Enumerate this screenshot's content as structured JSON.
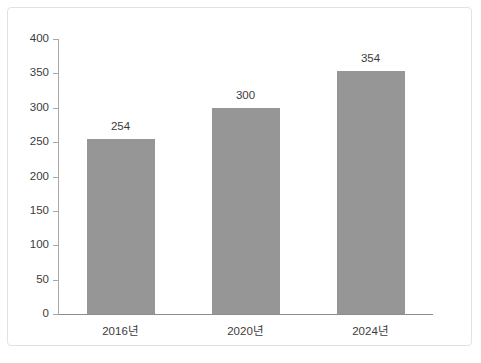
{
  "chart_data": {
    "type": "bar",
    "title": "",
    "subtitle": "",
    "xlabel": "",
    "ylabel": "",
    "categories": [
      "2016년",
      "2020년",
      "2024년"
    ],
    "values": [
      254,
      300,
      354
    ],
    "data_labels": [
      "254",
      "300",
      "354"
    ],
    "ylim": [
      0,
      400
    ],
    "ytick_step": 50,
    "ytick_labels": [
      "0",
      "50",
      "100",
      "150",
      "200",
      "250",
      "300",
      "350",
      "400"
    ],
    "ytick_values": [
      0,
      50,
      100,
      150,
      200,
      250,
      300,
      350,
      400
    ],
    "grid": false,
    "legend": false,
    "legend_position": "none",
    "colors": {
      "bar_fill": "#969696",
      "axis_line": "#a8a8a8",
      "baseline": "#8c8c8c",
      "text": "#3b3b3b",
      "frame_border": "#e2e2e2",
      "background": "#ffffff"
    }
  }
}
